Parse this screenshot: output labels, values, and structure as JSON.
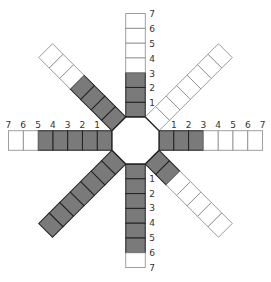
{
  "diagram": {
    "type": "octagon-arm-chart",
    "center": [
      135.5,
      140.5
    ],
    "apothem": 23.5,
    "arm_width": 19.5,
    "cell_length": 14.8,
    "colors": {
      "filled": "#7a7a7a",
      "empty": "#ffffff",
      "stroke": "#222222",
      "stroke_light": "#888888",
      "label": "#333333"
    },
    "arms": [
      {
        "name": "top",
        "angle": -90,
        "cells": 7,
        "filled": 3,
        "labels": [
          "1",
          "2",
          "3",
          "4",
          "5",
          "6",
          "7"
        ],
        "labeled": true
      },
      {
        "name": "upper-right",
        "angle": -45,
        "cells": 7,
        "filled": 0,
        "labels": [],
        "labeled": false
      },
      {
        "name": "right",
        "angle": 0,
        "cells": 7,
        "filled": 3,
        "labels": [
          "1",
          "2",
          "3",
          "4",
          "5",
          "6",
          "7"
        ],
        "labeled": true
      },
      {
        "name": "lower-right",
        "angle": 45,
        "cells": 7,
        "filled": 2,
        "labels": [],
        "labeled": false
      },
      {
        "name": "bottom",
        "angle": 90,
        "cells": 7,
        "filled": 6,
        "labels": [
          "1",
          "2",
          "3",
          "4",
          "5",
          "6",
          "7"
        ],
        "labeled": true
      },
      {
        "name": "lower-left",
        "angle": 135,
        "cells": 7,
        "filled": 7,
        "labels": [],
        "labeled": false
      },
      {
        "name": "left",
        "angle": 180,
        "cells": 7,
        "filled": 5,
        "labels": [
          "1",
          "2",
          "3",
          "4",
          "5",
          "6",
          "7"
        ],
        "labeled": true
      },
      {
        "name": "upper-left",
        "angle": -135,
        "cells": 7,
        "filled": 4,
        "labels": [],
        "labeled": false
      }
    ]
  }
}
